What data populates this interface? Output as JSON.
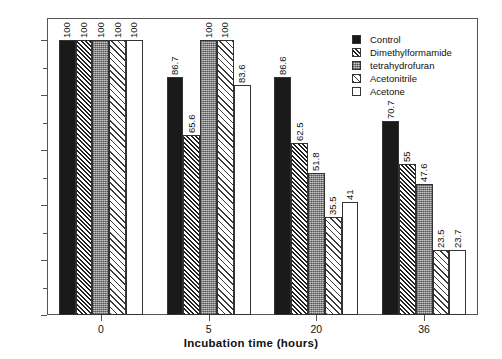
{
  "chart_data": {
    "type": "bar",
    "title": "",
    "xlabel": "Incubation time  (hours)",
    "ylabel": "Relative activity (%)",
    "categories": [
      "0",
      "5",
      "20",
      "36"
    ],
    "ylim": [
      0,
      108
    ],
    "yticks": [
      0,
      20,
      40,
      60,
      80,
      100
    ],
    "ytick_labels": [
      "0",
      "20",
      "40",
      "60",
      "80",
      "100"
    ],
    "yminor_ticks": [
      10,
      30,
      50,
      70,
      90
    ],
    "grid": false,
    "legend_position": "top-right-inside",
    "series": [
      {
        "name": "Control",
        "pattern": "solid-black",
        "values": [
          100,
          86.7,
          86.6,
          70.7
        ],
        "labels": [
          "100",
          "86.7",
          "86.6",
          "70.7"
        ]
      },
      {
        "name": "Dimethylformamide",
        "pattern": "dense-diagonal-hatch",
        "values": [
          100,
          65.6,
          62.5,
          55
        ],
        "labels": [
          "100",
          "65.6",
          "62.5",
          "55"
        ]
      },
      {
        "name": "tetrahydrofuran",
        "pattern": "gray-stipple",
        "values": [
          100,
          100,
          51.8,
          47.6
        ],
        "labels": [
          "100",
          "100",
          "51.8",
          "47.6"
        ]
      },
      {
        "name": "Acetonitrile",
        "pattern": "sparse-diagonal-hatch",
        "values": [
          100,
          100,
          35.5,
          23.5
        ],
        "labels": [
          "100",
          "100",
          "35.5",
          "23.5"
        ]
      },
      {
        "name": "Acetone",
        "pattern": "white-open",
        "values": [
          100,
          83.6,
          41,
          23.7
        ],
        "labels": [
          "100",
          "83.6",
          "41",
          "23.7"
        ]
      }
    ]
  },
  "axes": {
    "y_title": "Relative activity (%)",
    "x_title": "Incubation time  (hours)"
  },
  "legend": {
    "items": [
      {
        "label": "Control"
      },
      {
        "label": "Dimethylformamide"
      },
      {
        "label": "tetrahydrofuran"
      },
      {
        "label": "Acetonitrile"
      },
      {
        "label": "Acetone"
      }
    ]
  }
}
